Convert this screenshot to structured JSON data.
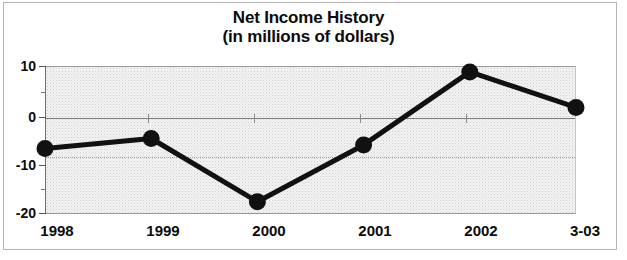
{
  "chart_data": {
    "type": "line",
    "title": "Net Income History",
    "subtitle": "(in millions of dollars)",
    "xlabel": "",
    "ylabel": "",
    "categories": [
      "1998",
      "1999",
      "2000",
      "2001",
      "2002",
      "3-03"
    ],
    "values": [
      -6.7,
      -4.7,
      -17.5,
      -6.0,
      8.8,
      1.6
    ],
    "series": [
      {
        "name": "Net Income",
        "values": [
          -6.7,
          -4.7,
          -17.5,
          -6.0,
          8.8,
          1.6
        ]
      }
    ],
    "ylim": [
      -20,
      10
    ],
    "ytick_labels": [
      "10",
      "0",
      "-10",
      "-20"
    ],
    "ytick_values": [
      10,
      0,
      -10,
      -20
    ],
    "yminor_tick_values": [
      5,
      -5,
      -15
    ],
    "xtick_labels": [
      "1998",
      "1999",
      "2000",
      "2001",
      "2002",
      "3-03"
    ],
    "grid": true,
    "gridlines": "horizontal",
    "legend": false,
    "legend_position": "none",
    "marker": "filled-circle",
    "line_color": "#111111",
    "marker_color": "#111111",
    "plot_background": "#f2f2f2",
    "annotations": []
  },
  "figure": {
    "title_line_1": "Net Income History",
    "title_line_2": "(in millions of dollars)"
  },
  "axis": {
    "y_labels": [
      "10",
      "0",
      "-10",
      "-20"
    ],
    "x_labels": [
      "1998",
      "1999",
      "2000",
      "2001",
      "2002",
      "3-03"
    ]
  }
}
